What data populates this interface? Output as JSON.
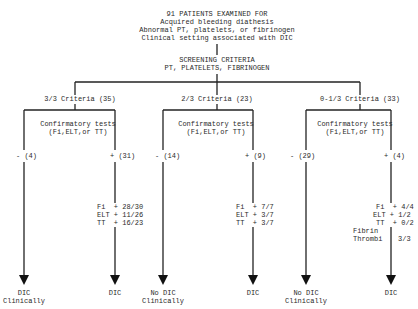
{
  "header": {
    "title": "91 PATIENTS EXAMINED FOR",
    "lines": [
      "Acquired bleeding diathesis",
      "Abnormal PT, platelets, or fibrinogen",
      "Clinical setting associated with DIC"
    ]
  },
  "screening": {
    "title": "SCREENING CRITERIA",
    "subtitle": "PT, PLATELETS, FIBRINOGEN"
  },
  "branches": [
    {
      "criteria": "3/3 Criteria (35)",
      "confirm_line1": "Confirmatory tests",
      "confirm_line2": "(Fi,ELT,or TT)",
      "negative": "- (4)",
      "positive": "+ (31)",
      "results": [
        {
          "test": "Fi",
          "op": "+",
          "value": "28/30"
        },
        {
          "test": "ELT",
          "op": "+",
          "value": "11/26"
        },
        {
          "test": "TT",
          "op": "+",
          "value": "16/23"
        }
      ],
      "negative_outcome_1": "DIC",
      "negative_outcome_2": "Clinically",
      "positive_outcome": "DIC"
    },
    {
      "criteria": "2/3 Criteria (23)",
      "confirm_line1": "Confirmatory tests",
      "confirm_line2": "(Fi,ELT,or TT)",
      "negative": "- (14)",
      "positive": "+ (9)",
      "results": [
        {
          "test": "Fi",
          "op": "+",
          "value": "7/7"
        },
        {
          "test": "ELT",
          "op": "+",
          "value": "3/7"
        },
        {
          "test": "TT",
          "op": "+",
          "value": "3/7"
        }
      ],
      "negative_outcome_1": "No DIC",
      "negative_outcome_2": "Clinically",
      "positive_outcome": "DIC"
    },
    {
      "criteria": "0-1/3 Criteria (33)",
      "confirm_line1": "Confirmatory tests",
      "confirm_line2": "(Fi,ELT,or TT)",
      "negative": "- (29)",
      "positive": "+ (4)",
      "results": [
        {
          "test": "Fi",
          "op": "+",
          "value": "4/4"
        },
        {
          "test": "ELT",
          "op": "+",
          "value": "1/2"
        },
        {
          "test": "TT",
          "op": "+",
          "value": "0/2"
        }
      ],
      "extra_result": {
        "line1": "Fibrin",
        "line2": "Thrombi",
        "value": "3/3"
      },
      "negative_outcome_1": "No DIC",
      "negative_outcome_2": "Clinically",
      "positive_outcome": "DIC"
    }
  ]
}
